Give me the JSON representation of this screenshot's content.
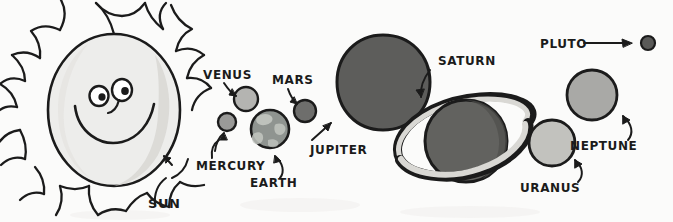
{
  "diagram": {
    "style": "hand-drawn pen and grayscale wash sketch",
    "background_color": "#fbfbfa",
    "ink_color": "#1b1b1b"
  },
  "sun": {
    "label": "SUN",
    "body_color": "#ededeb",
    "shadow_color": "#d8d7d4",
    "ray_count": 13,
    "has_face": true,
    "face": {
      "eyes": 2,
      "has_nose": true,
      "has_smile": true
    },
    "center_x": 114,
    "center_y": 110,
    "radius_x": 66,
    "radius_y": 76,
    "label_x": 148,
    "label_y": 208,
    "font_size": 13
  },
  "planets": [
    {
      "name": "MERCURY",
      "color": "#9a9a98",
      "cx": 227,
      "cy": 122,
      "r": 9,
      "label_x": 196,
      "label_y": 170,
      "font_size": 12,
      "arrow": "curve-up-right",
      "textured": false
    },
    {
      "name": "VENUS",
      "color": "#b4b4b1",
      "cx": 246,
      "cy": 99,
      "r": 12,
      "label_x": 203,
      "label_y": 79,
      "font_size": 12,
      "arrow": "curve-down-right",
      "textured": false
    },
    {
      "name": "EARTH",
      "color": "#8f9490",
      "cx": 270,
      "cy": 129,
      "r": 19,
      "label_x": 250,
      "label_y": 187,
      "font_size": 12,
      "arrow": "curve-up-left",
      "textured": true
    },
    {
      "name": "MARS",
      "color": "#6e6e6c",
      "cx": 305,
      "cy": 111,
      "r": 11,
      "label_x": 272,
      "label_y": 84,
      "font_size": 12,
      "arrow": "curve-down-right",
      "textured": false
    },
    {
      "name": "JUPITER",
      "color": "#5d5d5b",
      "cx": 383,
      "cy": 82,
      "r": 47,
      "label_x": 310,
      "label_y": 154,
      "font_size": 12,
      "arrow": "straight-up-right",
      "textured": false
    },
    {
      "name": "SATURN",
      "color": "#62625f",
      "cx": 466,
      "cy": 141,
      "r": 41,
      "label_x": 438,
      "label_y": 65,
      "font_size": 12,
      "arrow": "curve-down-left",
      "has_ring": true,
      "ring_color": "#d9d8d4",
      "ring_angle": -22,
      "textured": false
    },
    {
      "name": "URANUS",
      "color": "#c2c2be",
      "cx": 552,
      "cy": 143,
      "r": 23,
      "label_x": 520,
      "label_y": 192,
      "font_size": 12,
      "arrow": "hook-up-left",
      "textured": false
    },
    {
      "name": "NEPTUNE",
      "color": "#a9a9a6",
      "cx": 592,
      "cy": 95,
      "r": 25,
      "label_x": 570,
      "label_y": 150,
      "font_size": 12,
      "arrow": "hook-up-left",
      "textured": false
    },
    {
      "name": "PLUTO",
      "color": "#5a5a58",
      "cx": 648,
      "cy": 43,
      "r": 7,
      "label_x": 540,
      "label_y": 48,
      "font_size": 12,
      "arrow": "straight-right-long",
      "textured": false
    }
  ]
}
